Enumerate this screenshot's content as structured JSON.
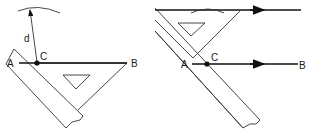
{
  "figure_left": {
    "labels": {
      "a": "A",
      "b": "B",
      "c": "C",
      "d": "d"
    },
    "description": "Ruler with set square along line AB; arc of radius d swung from point C"
  },
  "figure_right": {
    "labels": {
      "a": "A",
      "b": "B",
      "c": "C"
    },
    "description": "Set square slid along ruler to draw a line parallel to AB at distance d, tangent to the arc"
  },
  "colors": {
    "line": "#111111",
    "background": "#ffffff"
  }
}
